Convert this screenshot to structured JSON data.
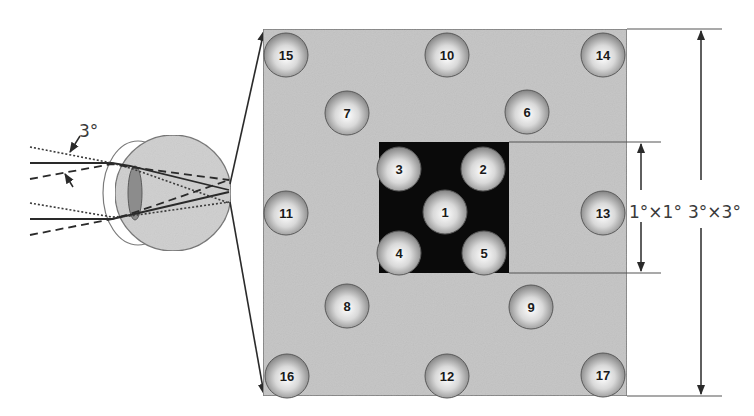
{
  "diagram": {
    "title": "",
    "colors": {
      "field_gray": "#c4c4c4",
      "field_border": "#707070",
      "center_box": "#0a0a0a",
      "eye_globe": "#cfcfcf",
      "eye_lens": "#8c8c8c",
      "line": "#2a2a2a"
    },
    "eye": {
      "angle_label": "3°",
      "globe": {
        "cx": 173,
        "cy": 193,
        "r": 58
      },
      "lens": {
        "cx": 135,
        "cy": 193,
        "rx": 7,
        "ry": 27
      },
      "focal_point": {
        "x": 229,
        "y": 192
      }
    },
    "field": {
      "outer_box": {
        "x": 263,
        "y": 29,
        "w": 364,
        "h": 367
      },
      "inner_box": {
        "x": 379,
        "y": 142,
        "w": 130,
        "h": 131
      },
      "inner_dimension_label": "1°×1°",
      "outer_dimension_label": "3°×3°"
    },
    "balls": [
      {
        "label": "1",
        "x": 445,
        "y": 212
      },
      {
        "label": "2",
        "x": 483,
        "y": 169
      },
      {
        "label": "3",
        "x": 399,
        "y": 169
      },
      {
        "label": "4",
        "x": 399,
        "y": 253
      },
      {
        "label": "5",
        "x": 484,
        "y": 253
      },
      {
        "label": "6",
        "x": 527,
        "y": 112
      },
      {
        "label": "7",
        "x": 347,
        "y": 113
      },
      {
        "label": "8",
        "x": 347,
        "y": 306
      },
      {
        "label": "9",
        "x": 531,
        "y": 307
      },
      {
        "label": "10",
        "x": 447,
        "y": 55
      },
      {
        "label": "11",
        "x": 286,
        "y": 213
      },
      {
        "label": "12",
        "x": 447,
        "y": 376
      },
      {
        "label": "13",
        "x": 603,
        "y": 213
      },
      {
        "label": "14",
        "x": 603,
        "y": 55
      },
      {
        "label": "15",
        "x": 286,
        "y": 55
      },
      {
        "label": "16",
        "x": 287,
        "y": 376
      },
      {
        "label": "17",
        "x": 603,
        "y": 375
      }
    ]
  }
}
